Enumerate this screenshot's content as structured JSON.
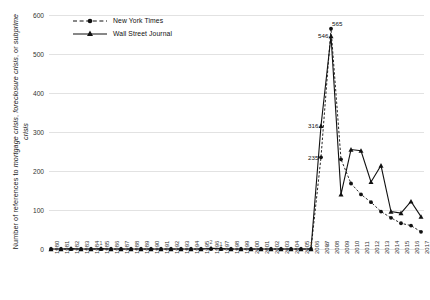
{
  "chart_data": {
    "type": "line",
    "title": "",
    "xlabel": "",
    "ylabel": "Number of references to mortgage crisis, foreclosure crisis, or subprime crisis",
    "ylabel_italic_terms": [
      "mortgage crisis",
      "foreclosure crisis",
      "subprime crisis"
    ],
    "ylim": [
      0,
      600
    ],
    "yticks": [
      0,
      100,
      200,
      300,
      400,
      500,
      600
    ],
    "grid": true,
    "legend_position": "top-left",
    "categories": [
      "1980",
      "1981",
      "1982",
      "1983",
      "1984",
      "1985",
      "1986",
      "1987",
      "1988",
      "1989",
      "1990",
      "1991",
      "1992",
      "1993",
      "1994",
      "1995",
      "1996",
      "1997",
      "1998",
      "1999",
      "2000",
      "2001",
      "2002",
      "2003",
      "2004",
      "2005",
      "2006",
      "2007",
      "2008",
      "2009",
      "2010",
      "2011",
      "2012",
      "2013",
      "2014",
      "2015",
      "2016",
      "2017"
    ],
    "series": [
      {
        "name": "New York Times",
        "marker": "circle",
        "linestyle": "dashed",
        "color": "#111111",
        "values": [
          0,
          0,
          0,
          0,
          0,
          0,
          0,
          0,
          0,
          0,
          0,
          0,
          0,
          0,
          0,
          0,
          0,
          0,
          0,
          0,
          0,
          0,
          0,
          0,
          0,
          0,
          0,
          235,
          565,
          230,
          168,
          140,
          120,
          96,
          80,
          66,
          60,
          44
        ]
      },
      {
        "name": "Wall Street Journal",
        "marker": "triangle",
        "linestyle": "solid",
        "color": "#111111",
        "values": [
          0,
          0,
          1,
          0,
          0,
          1,
          0,
          0,
          0,
          0,
          0,
          0,
          0,
          0,
          0,
          0,
          2,
          1,
          0,
          0,
          0,
          0,
          0,
          0,
          0,
          0,
          0,
          316,
          546,
          140,
          255,
          252,
          172,
          214,
          96,
          92,
          122,
          83
        ]
      }
    ],
    "annotations": [
      {
        "text": "565",
        "x": "2008",
        "series": "New York Times",
        "value": 565
      },
      {
        "text": "546",
        "x": "2008",
        "series": "Wall Street Journal",
        "value": 546
      },
      {
        "text": "316",
        "x": "2007",
        "series": "Wall Street Journal",
        "value": 316
      },
      {
        "text": "235",
        "x": "2007",
        "series": "New York Times",
        "value": 235
      },
      {
        "text": "1",
        "x": "1985",
        "value": 1
      },
      {
        "text": "2",
        "x": "1996",
        "value": 2
      },
      {
        "text": "1",
        "x": "1997",
        "value": 1
      },
      {
        "text": "1",
        "x": "2006",
        "value": 1
      },
      {
        "text": "0",
        "x": "2007",
        "value": 0
      }
    ]
  },
  "legend": {
    "items": [
      {
        "label": "New York Times"
      },
      {
        "label": "Wall Street Journal"
      }
    ]
  },
  "yaxis": {
    "title_prefix": "Number of references to ",
    "title_t1": "mortgage crisis",
    "title_mid1": ", ",
    "title_t2": "foreclosure crisis",
    "title_mid2": ", or ",
    "title_t3": "subprime crisis"
  }
}
